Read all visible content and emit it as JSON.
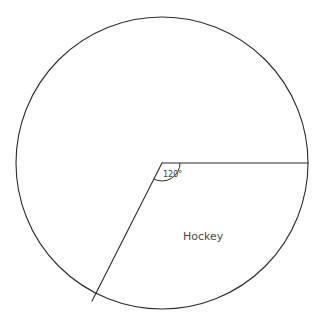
{
  "chart_data": {
    "type": "pie",
    "title": "",
    "subtitle": "",
    "xlabel": "",
    "ylabel": "",
    "legend_position": "none",
    "grid": false,
    "units": "degrees",
    "total_degrees": 360,
    "center": {
      "x": 162,
      "y": 163
    },
    "radius": 146,
    "categories": [
      "Hockey",
      ""
    ],
    "values": [
      240,
      120
    ],
    "slices": [
      {
        "label": "Hockey",
        "angle_degrees": 240,
        "start_angle_degrees": 0,
        "end_angle_degrees": 240,
        "label_shown": true,
        "label_x": 202,
        "label_y": 236
      },
      {
        "label": "",
        "angle_degrees": 120,
        "start_angle_degrees": 240,
        "end_angle_degrees": 360,
        "label_shown": false,
        "angle_marker": "120°"
      }
    ],
    "annotations": [
      {
        "text": "120°",
        "x": 172,
        "y": 174,
        "target": "center-angle"
      },
      {
        "text": "Hockey",
        "x": 202,
        "y": 236,
        "target": "hockey-sector"
      }
    ],
    "colors": {
      "background": "#ffffff",
      "stroke": "#2b2b2b",
      "slice_fill": "#ffffff",
      "angle_text": "#3a3a3a",
      "label_text": "#4a4a4a"
    }
  },
  "diagram": {
    "angle_label": "120°",
    "sector_label": "Hockey"
  },
  "geometry": {
    "circle": {
      "cx": 162,
      "cy": 163,
      "r": 146
    },
    "radius_horizontal": {
      "x1": 162,
      "y1": 163,
      "x2": 308,
      "y2": 163
    },
    "radius_lower_left": {
      "x1": 162,
      "y1": 163,
      "x2": 92,
      "y2": 301
    },
    "angle_arc": {
      "radius": 18,
      "from_degrees": 0,
      "to_degrees": 117
    }
  }
}
